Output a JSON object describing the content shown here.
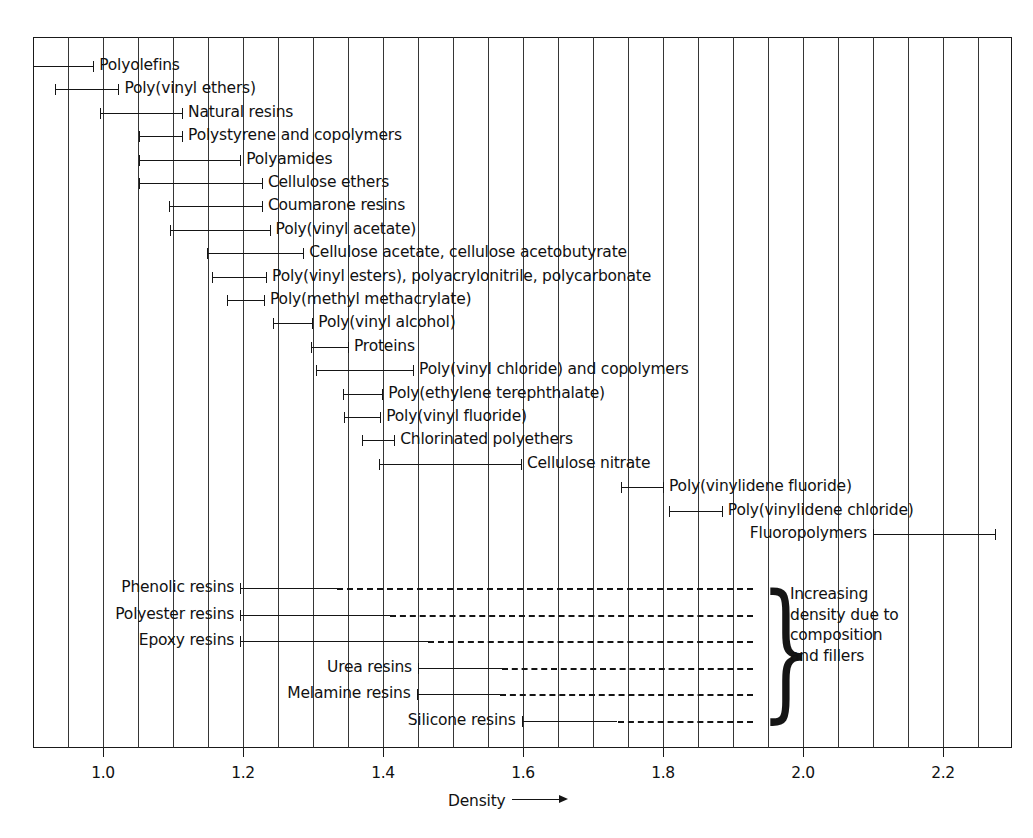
{
  "chart_data": {
    "type": "bar",
    "xlabel": "Density",
    "ylabel": "",
    "xlim": [
      0.9,
      2.3
    ],
    "tick_labels": [
      "1.0",
      "1.2",
      "1.4",
      "1.6",
      "1.8",
      "2.0",
      "2.2"
    ],
    "tick_values": [
      1.0,
      1.2,
      1.4,
      1.6,
      1.8,
      2.0,
      2.2
    ],
    "minor_tick_step": 0.05,
    "grid": true,
    "legend": null,
    "axis_arrow": true,
    "bars": [
      {
        "label": "Polyolefins",
        "start": 0.9,
        "end": 0.986,
        "label_side": "right",
        "style": "solid",
        "left_cap": false,
        "right_cap": true
      },
      {
        "label": "Poly(vinyl ethers)",
        "start": 0.932,
        "end": 1.022,
        "label_side": "right",
        "style": "solid",
        "left_cap": true,
        "right_cap": true
      },
      {
        "label": "Natural resins",
        "start": 0.996,
        "end": 1.113,
        "label_side": "right",
        "style": "solid",
        "left_cap": true,
        "right_cap": true
      },
      {
        "label": "Polystyrene and copolymers",
        "start": 1.052,
        "end": 1.113,
        "label_side": "right",
        "style": "solid",
        "left_cap": true,
        "right_cap": true
      },
      {
        "label": "Polyamides",
        "start": 1.052,
        "end": 1.196,
        "label_side": "right",
        "style": "solid",
        "left_cap": true,
        "right_cap": true
      },
      {
        "label": "Cellulose ethers",
        "start": 1.052,
        "end": 1.227,
        "label_side": "right",
        "style": "solid",
        "left_cap": true,
        "right_cap": true
      },
      {
        "label": "Coumarone resins",
        "start": 1.094,
        "end": 1.227,
        "label_side": "right",
        "style": "solid",
        "left_cap": true,
        "right_cap": true
      },
      {
        "label": "Poly(vinyl acetate)",
        "start": 1.095,
        "end": 1.238,
        "label_side": "right",
        "style": "solid",
        "left_cap": true,
        "right_cap": true
      },
      {
        "label": "Cellulose acetate, cellulose acetobutyrate",
        "start": 1.149,
        "end": 1.286,
        "label_side": "right",
        "style": "solid",
        "left_cap": true,
        "right_cap": true
      },
      {
        "label": "Poly(vinyl esters), polyacrylonitrile, polycarbonate",
        "start": 1.156,
        "end": 1.233,
        "label_side": "right",
        "style": "solid",
        "left_cap": true,
        "right_cap": true
      },
      {
        "label": "Poly(methyl methacrylate)",
        "start": 1.177,
        "end": 1.23,
        "label_side": "right",
        "style": "solid",
        "left_cap": true,
        "right_cap": true
      },
      {
        "label": "Poly(vinyl alcohol)",
        "start": 1.243,
        "end": 1.299,
        "label_side": "right",
        "style": "solid",
        "left_cap": true,
        "right_cap": true
      },
      {
        "label": "Proteins",
        "start": 1.297,
        "end": 1.35,
        "label_side": "right",
        "style": "solid",
        "left_cap": true,
        "right_cap": true
      },
      {
        "label": "Poly(vinyl chloride) and copolymers",
        "start": 1.304,
        "end": 1.443,
        "label_side": "right",
        "style": "solid",
        "left_cap": true,
        "right_cap": true
      },
      {
        "label": "Poly(ethylene terephthalate)",
        "start": 1.343,
        "end": 1.399,
        "label_side": "right",
        "style": "solid",
        "left_cap": true,
        "right_cap": true
      },
      {
        "label": "Poly(vinyl fluoride)",
        "start": 1.344,
        "end": 1.396,
        "label_side": "right",
        "style": "solid",
        "left_cap": true,
        "right_cap": true
      },
      {
        "label": "Chlorinated polyethers",
        "start": 1.37,
        "end": 1.416,
        "label_side": "right",
        "style": "solid",
        "left_cap": true,
        "right_cap": true
      },
      {
        "label": "Cellulose nitrate",
        "start": 1.394,
        "end": 1.597,
        "label_side": "right",
        "style": "solid",
        "left_cap": true,
        "right_cap": true
      },
      {
        "label": "Poly(vinylidene fluoride)",
        "start": 1.74,
        "end": 1.8,
        "label_side": "right",
        "style": "solid",
        "left_cap": true,
        "right_cap": true
      },
      {
        "label": "Poly(vinylidene chloride)",
        "start": 1.808,
        "end": 1.884,
        "label_side": "right",
        "style": "solid",
        "left_cap": true,
        "right_cap": true
      },
      {
        "label": "Fluoropolymers",
        "start": 2.1,
        "end": 2.274,
        "label_side": "left",
        "style": "solid",
        "left_cap": true,
        "right_cap": true
      }
    ],
    "thermoset_bars": [
      {
        "label": "Phenolic resins",
        "start": 1.196,
        "solid_end": 1.334,
        "dashed_end": 1.928,
        "label_side": "left",
        "left_cap": true
      },
      {
        "label": "Polyester resins",
        "start": 1.196,
        "solid_end": 1.41,
        "dashed_end": 1.928,
        "label_side": "left",
        "left_cap": true
      },
      {
        "label": "Epoxy resins",
        "start": 1.196,
        "solid_end": 1.464,
        "dashed_end": 1.928,
        "label_side": "left",
        "left_cap": true
      },
      {
        "label": "Urea resins",
        "start": 1.45,
        "solid_end": 1.57,
        "dashed_end": 1.928,
        "label_side": "left",
        "left_cap": true
      },
      {
        "label": "Melamine resins",
        "start": 1.448,
        "solid_end": 1.567,
        "dashed_end": 1.928,
        "label_side": "left",
        "left_cap": true
      },
      {
        "label": "Silicone resins",
        "start": 1.598,
        "solid_end": 1.735,
        "dashed_end": 1.928,
        "label_side": "left",
        "left_cap": true
      }
    ],
    "annotation": {
      "brace": "}",
      "text": "Increasing\ndensity due to\ncomposition\nand fillers"
    }
  }
}
